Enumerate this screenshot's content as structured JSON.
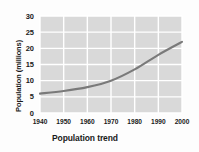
{
  "chart_data": {
    "type": "line",
    "title": "",
    "subtitle": "",
    "xlabel": "Population trend",
    "ylabel": "Population (millions)",
    "x": [
      1940,
      1950,
      1960,
      1970,
      1980,
      1990,
      2000
    ],
    "values": [
      6,
      6.8,
      8,
      10,
      13.5,
      18,
      22
    ],
    "series": [
      {
        "name": "Population",
        "values": [
          6,
          6.8,
          8,
          10,
          13.5,
          18,
          22
        ]
      }
    ],
    "xtick_labels": [
      "1940",
      "1950",
      "1960",
      "1970",
      "1980",
      "1990",
      "2000"
    ],
    "ytick_labels": [
      "0",
      "5",
      "10",
      "15",
      "20",
      "25",
      "30"
    ],
    "ytick_values": [
      0,
      5,
      10,
      15,
      20,
      25,
      30
    ],
    "xlim": [
      1940,
      2000
    ],
    "ylim": [
      0,
      30
    ],
    "grid": true,
    "grid_color": "#ffffff",
    "legend": false,
    "legend_position": "none",
    "line_color": "#7a7a7a",
    "plot_background": "#d9d9d9",
    "figure_background": "#fdfdfd",
    "text_color": "#1a1a1a"
  },
  "axis": {
    "y_title": "Population (millions)",
    "x_title": "Population trend"
  }
}
